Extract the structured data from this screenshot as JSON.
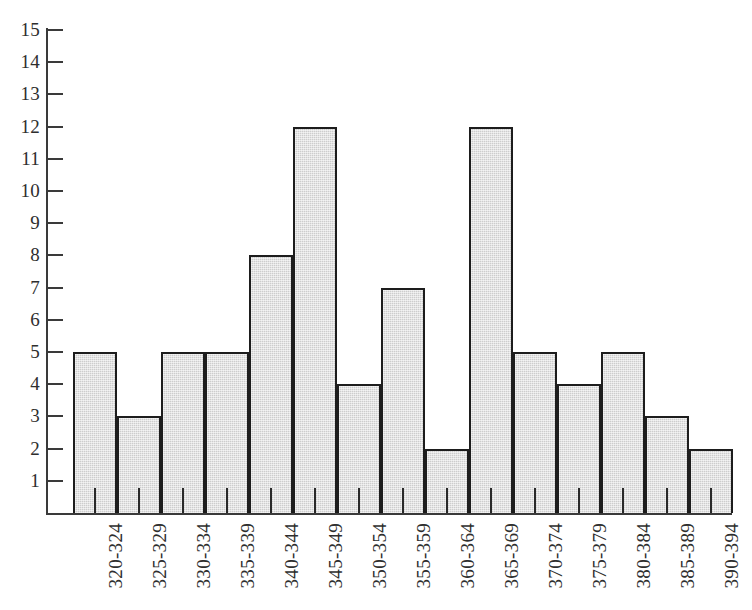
{
  "chart_data": {
    "type": "bar",
    "title": "",
    "subtitle": "",
    "xlabel": "",
    "ylabel": "",
    "categories": [
      "320-324",
      "325-329",
      "330-334",
      "335-339",
      "340-344",
      "345-349",
      "350-354",
      "355-359",
      "360-364",
      "365-369",
      "370-374",
      "375-379",
      "380-384",
      "385-389",
      "390-394"
    ],
    "values": [
      5,
      3,
      5,
      5,
      8,
      12,
      4,
      7,
      2,
      12,
      5,
      4,
      5,
      3,
      2
    ],
    "ylim": [
      0,
      15
    ],
    "ytick_labels": [
      "1",
      "2",
      "3",
      "4",
      "5",
      "6",
      "7",
      "8",
      "9",
      "10",
      "11",
      "12",
      "13",
      "14",
      "15"
    ],
    "ytick_values": [
      1,
      2,
      3,
      4,
      5,
      6,
      7,
      8,
      9,
      10,
      11,
      12,
      13,
      14,
      15
    ],
    "grid": false,
    "legend": null,
    "legend_position": "none",
    "bar_fill_color": "#cdcdcd",
    "bar_border_color": "#1d1d1d",
    "axis_color": "#3a3a3a",
    "background_color": "#ffffff",
    "xtick_label_rotation": 90,
    "annotations": []
  }
}
